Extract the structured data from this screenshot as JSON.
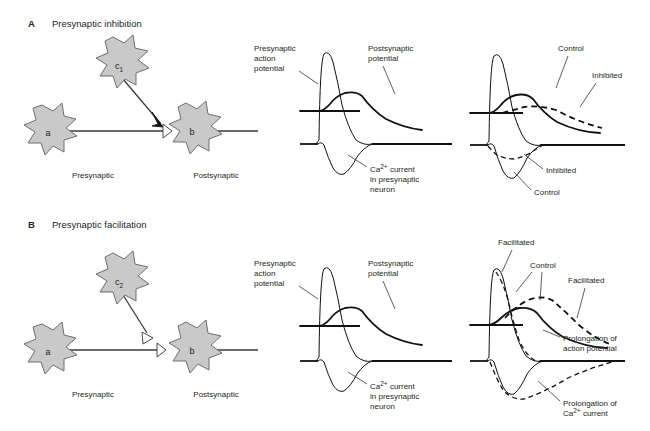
{
  "figure": {
    "background_color": "#ffffff",
    "ink_color": "#231f20",
    "cell_fill_color": "#c9c9c9",
    "cell_stroke_color": "#6e6e6e"
  },
  "panels": [
    {
      "letter": "A",
      "title": "Presynaptic inhibition",
      "circuit": {
        "cells": [
          {
            "id": "a",
            "label": "a",
            "role": "presynaptic-neuron"
          },
          {
            "id": "b",
            "label": "b",
            "role": "postsynaptic-neuron"
          },
          {
            "id": "c1",
            "label": "c",
            "sublabel": "1",
            "role": "modulatory-interneuron"
          }
        ],
        "side_labels": {
          "left": "Presynaptic",
          "right": "Postsynaptic"
        },
        "terminals": {
          "modulatory": "filled-arrowhead",
          "primary": "open-triangle"
        }
      },
      "traces_middle": {
        "labels": [
          "Presynaptic action potential",
          "Postsynaptic potential",
          "Ca2+ current in presynaptic neuron"
        ],
        "label_presynaptic_ap_lines": [
          "Presynaptic",
          "action",
          "potential"
        ],
        "label_postsynaptic_lines": [
          "Postsynaptic",
          "potential"
        ],
        "label_calcium_lines": [
          "Ca",
          "2+",
          " current",
          "in presynaptic",
          "neuron"
        ]
      },
      "traces_right": {
        "upper_labels": [
          "Control",
          "Inhibited"
        ],
        "lower_labels": [
          "Inhibited",
          "Control"
        ]
      }
    },
    {
      "letter": "B",
      "title": "Presynaptic facilitation",
      "circuit": {
        "cells": [
          {
            "id": "a",
            "label": "a",
            "role": "presynaptic-neuron"
          },
          {
            "id": "b",
            "label": "b",
            "role": "postsynaptic-neuron"
          },
          {
            "id": "c2",
            "label": "c",
            "sublabel": "2",
            "role": "modulatory-interneuron"
          }
        ],
        "side_labels": {
          "left": "Presynaptic",
          "right": "Postsynaptic"
        },
        "terminals": {
          "modulatory": "open-triangle",
          "primary": "open-triangle"
        }
      },
      "traces_middle": {
        "labels": [
          "Presynaptic action potential",
          "Postsynaptic potential",
          "Ca2+ current in presynaptic neuron"
        ],
        "label_presynaptic_ap_lines": [
          "Presynaptic",
          "action",
          "potential"
        ],
        "label_postsynaptic_lines": [
          "Postsynaptic",
          "potential"
        ],
        "label_calcium_lines": [
          "Ca",
          "2+",
          " current",
          "in presynaptic",
          "neuron"
        ]
      },
      "traces_right": {
        "upper_labels": [
          "Facilitated",
          "Control",
          "Facilitated"
        ],
        "annotation_action_potential_lines": [
          "Prolongation of",
          "action potential"
        ],
        "annotation_calcium_lines": [
          "Prolongation of",
          "Ca",
          "2+",
          " current"
        ]
      }
    }
  ],
  "glyphs": {
    "calcium_base": "Ca",
    "calcium_charge": "2+",
    "current_word": " current"
  }
}
